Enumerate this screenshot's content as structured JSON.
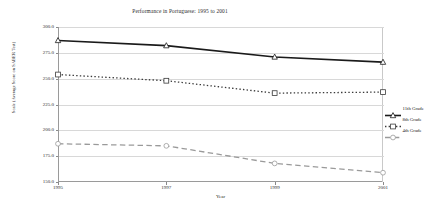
{
  "chart_data": {
    "type": "line",
    "title": "Performance in Portuguese: 1995 to 2001",
    "xlabel": "Year",
    "ylabel": "Scale (Average Score on SABER Test)",
    "x": [
      1995,
      1997,
      1999,
      2001
    ],
    "xtick_labels": [
      "1995",
      "1997",
      "1999",
      "2001"
    ],
    "xlim": [
      1995,
      2001
    ],
    "ylim": [
      150.0,
      300.0
    ],
    "ytick_labels": [
      "150.0",
      "175.0",
      "200.0",
      "225.0",
      "250.0",
      "275.0",
      "300.0"
    ],
    "yticks": [
      150.0,
      175.0,
      200.0,
      225.0,
      250.0,
      275.0,
      300.0
    ],
    "grid": true,
    "legend_position": "right",
    "series": [
      {
        "name": "11th Grade",
        "values": [
          287.0,
          282.0,
          271.0,
          266.0
        ],
        "style": "solid",
        "marker": "triangle",
        "color": "#1a1a1a",
        "width": 1.6
      },
      {
        "name": "8th Grade",
        "values": [
          254.0,
          248.0,
          236.0,
          237.0
        ],
        "style": "dotted",
        "marker": "square",
        "color": "#3a3a3a",
        "width": 1.3
      },
      {
        "name": "4th Grade",
        "values": [
          187.0,
          185.0,
          168.0,
          159.0
        ],
        "style": "dashed",
        "marker": "circle",
        "color": "#9a9a9a",
        "width": 1.3
      }
    ]
  }
}
